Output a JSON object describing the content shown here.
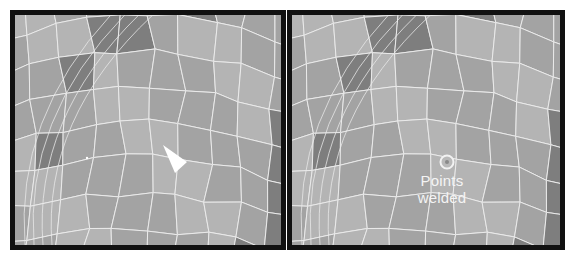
{
  "panels": [
    {
      "id": "before",
      "marker": "selected-polygon-triangle",
      "description": "Mesh with a selected triangular polygon"
    },
    {
      "id": "after",
      "marker": "welded-point-circle",
      "label_lines": [
        "Points",
        "welded"
      ]
    }
  ],
  "colors": {
    "frame": "#111111",
    "mesh_light": "#b4b4b4",
    "mesh_mid": "#a3a3a3",
    "mesh_dark": "#7e7e7e",
    "wire": "#eaeaea",
    "selection": "#ffffff"
  }
}
